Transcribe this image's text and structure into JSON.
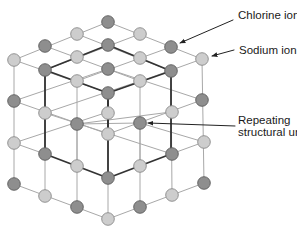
{
  "colors": {
    "chlorine_fill": "#8e8e8e",
    "chlorine_stroke": "#5e5e5e",
    "sodium_fill": "#cdcdcd",
    "sodium_stroke": "#8a8a8a",
    "thin_line": "#a8a8a8",
    "thick_line": "#333333",
    "arrow": "#222222"
  },
  "labels": {
    "chlorine": "Chlorine ion",
    "sodium": "Sodium ion",
    "unit_line1": "Repeating",
    "unit_line2": "structural unit"
  },
  "legend": [
    {
      "ion": "chlorine",
      "shade": "dark"
    },
    {
      "ion": "sodium",
      "shade": "light"
    }
  ],
  "nodes": [
    {
      "x": 108,
      "y": 22,
      "t": "d"
    },
    {
      "x": 77,
      "y": 34,
      "t": "l"
    },
    {
      "x": 140,
      "y": 34,
      "t": "l"
    },
    {
      "x": 45,
      "y": 46,
      "t": "d"
    },
    {
      "x": 108,
      "y": 45,
      "t": "d"
    },
    {
      "x": 171,
      "y": 47,
      "t": "d"
    },
    {
      "x": 14,
      "y": 60,
      "t": "l"
    },
    {
      "x": 77,
      "y": 57,
      "t": "l"
    },
    {
      "x": 140,
      "y": 58,
      "t": "l"
    },
    {
      "x": 202,
      "y": 59,
      "t": "l"
    },
    {
      "x": 45,
      "y": 70,
      "t": "d"
    },
    {
      "x": 108,
      "y": 69,
      "t": "d"
    },
    {
      "x": 171,
      "y": 71,
      "t": "d"
    },
    {
      "x": 77,
      "y": 81,
      "t": "l"
    },
    {
      "x": 140,
      "y": 81,
      "t": "l"
    },
    {
      "x": 108,
      "y": 93,
      "t": "d"
    },
    {
      "x": 14,
      "y": 101,
      "t": "d"
    },
    {
      "x": 202,
      "y": 100,
      "t": "d"
    },
    {
      "x": 45,
      "y": 113,
      "t": "l"
    },
    {
      "x": 108,
      "y": 113,
      "t": "l"
    },
    {
      "x": 172,
      "y": 112,
      "t": "l"
    },
    {
      "x": 77,
      "y": 124,
      "t": "d"
    },
    {
      "x": 140,
      "y": 123,
      "t": "d"
    },
    {
      "x": 108,
      "y": 134,
      "t": "l"
    },
    {
      "x": 14,
      "y": 143,
      "t": "l"
    },
    {
      "x": 204,
      "y": 142,
      "t": "l"
    },
    {
      "x": 45,
      "y": 154,
      "t": "d"
    },
    {
      "x": 172,
      "y": 154,
      "t": "d"
    },
    {
      "x": 77,
      "y": 166,
      "t": "l"
    },
    {
      "x": 140,
      "y": 166,
      "t": "l"
    },
    {
      "x": 108,
      "y": 178,
      "t": "d"
    },
    {
      "x": 14,
      "y": 184,
      "t": "d"
    },
    {
      "x": 204,
      "y": 183,
      "t": "d"
    },
    {
      "x": 45,
      "y": 196,
      "t": "l"
    },
    {
      "x": 172,
      "y": 195,
      "t": "l"
    },
    {
      "x": 77,
      "y": 207,
      "t": "d"
    },
    {
      "x": 140,
      "y": 207,
      "t": "d"
    },
    {
      "x": 108,
      "y": 219,
      "t": "l"
    }
  ],
  "thin_edges": [
    [
      14,
      60,
      108,
      22
    ],
    [
      45,
      70,
      140,
      34
    ],
    [
      77,
      81,
      171,
      47
    ],
    [
      108,
      93,
      202,
      59
    ],
    [
      108,
      22,
      202,
      59
    ],
    [
      77,
      34,
      171,
      71
    ],
    [
      45,
      46,
      140,
      81
    ],
    [
      14,
      60,
      108,
      93
    ],
    [
      14,
      101,
      108,
      69
    ],
    [
      14,
      101,
      108,
      134
    ],
    [
      45,
      113,
      140,
      81
    ],
    [
      77,
      124,
      171,
      112
    ],
    [
      108,
      134,
      202,
      100
    ],
    [
      108,
      69,
      202,
      100
    ],
    [
      45,
      113,
      172,
      154
    ],
    [
      14,
      143,
      108,
      112
    ],
    [
      140,
      123,
      204,
      142
    ],
    [
      77,
      124,
      140,
      123
    ],
    [
      14,
      184,
      108,
      219
    ],
    [
      108,
      219,
      204,
      183
    ],
    [
      14,
      143,
      45,
      154
    ],
    [
      171,
      154,
      204,
      142
    ],
    [
      14,
      60,
      14,
      184
    ],
    [
      45,
      70,
      45,
      196
    ],
    [
      77,
      81,
      77,
      207
    ],
    [
      108,
      93,
      108,
      219
    ],
    [
      140,
      81,
      140,
      207
    ],
    [
      171,
      71,
      172,
      195
    ],
    [
      202,
      59,
      204,
      183
    ],
    [
      77,
      124,
      77,
      166
    ],
    [
      140,
      123,
      140,
      166
    ]
  ],
  "thick_edges": [
    [
      45,
      70,
      108,
      45
    ],
    [
      108,
      45,
      171,
      71
    ],
    [
      45,
      70,
      108,
      93
    ],
    [
      108,
      93,
      171,
      71
    ],
    [
      45,
      70,
      45,
      154
    ],
    [
      108,
      93,
      108,
      178
    ],
    [
      171,
      71,
      171,
      154
    ],
    [
      45,
      154,
      108,
      178
    ],
    [
      108,
      178,
      171,
      154
    ],
    [
      108,
      101,
      108,
      128
    ]
  ],
  "arrows": [
    {
      "name": "chlorine-arrow",
      "x1": 233,
      "y1": 20,
      "x2": 180,
      "y2": 43
    },
    {
      "name": "sodium-arrow",
      "x1": 234,
      "y1": 50,
      "x2": 212,
      "y2": 56
    },
    {
      "name": "unit-arrow",
      "x1": 235,
      "y1": 126,
      "x2": 148,
      "y2": 123
    }
  ]
}
